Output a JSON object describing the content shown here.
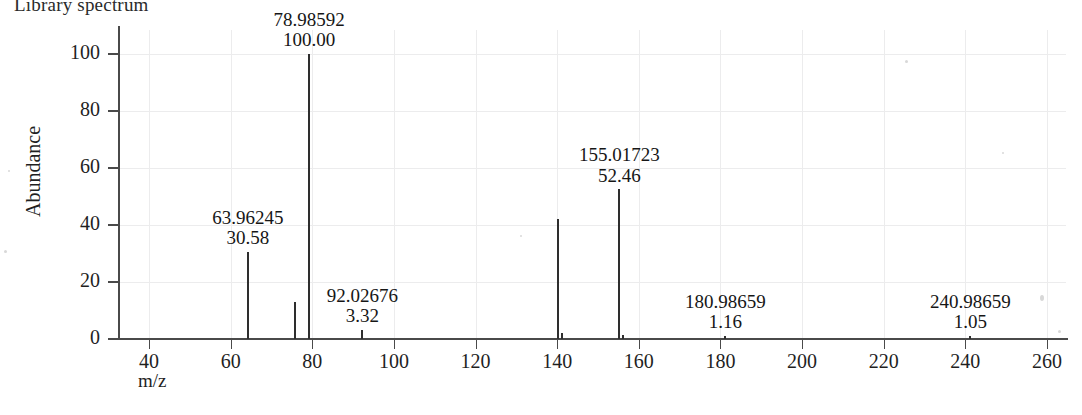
{
  "figure": {
    "title": "Library spectrum"
  },
  "axes": {
    "y_title": "Abundance",
    "x_title": "m/z",
    "y_ticks": [
      "0",
      "20",
      "40",
      "60",
      "80",
      "100"
    ],
    "x_ticks": [
      "40",
      "60",
      "80",
      "100",
      "120",
      "140",
      "160",
      "180",
      "200",
      "220",
      "240",
      "260"
    ]
  },
  "chart_data": {
    "type": "bar",
    "title": "Library spectrum",
    "xlabel": "m/z",
    "ylabel": "Abundance",
    "xlim": [
      30,
      265
    ],
    "ylim": [
      0,
      105
    ],
    "grid": true,
    "legend": "none",
    "x": [
      63.96245,
      75.5,
      78.98592,
      92.02676,
      140.0,
      155.01723,
      180.98659,
      240.98659
    ],
    "values": [
      30.58,
      13.0,
      100.0,
      3.32,
      42.0,
      52.46,
      1.16,
      1.05
    ],
    "labeled_peaks": [
      {
        "mz": "63.96245",
        "abundance": "30.58",
        "x": 63.96245,
        "y": 30.58
      },
      {
        "mz": "78.98592",
        "abundance": "100.00",
        "x": 78.98592,
        "y": 100.0
      },
      {
        "mz": "92.02676",
        "abundance": "3.32",
        "x": 92.02676,
        "y": 3.32
      },
      {
        "mz": "155.01723",
        "abundance": "52.46",
        "x": 155.01723,
        "y": 52.46
      },
      {
        "mz": "180.98659",
        "abundance": "1.16",
        "x": 180.98659,
        "y": 1.16
      },
      {
        "mz": "240.98659",
        "abundance": "1.05",
        "x": 240.98659,
        "y": 1.05
      }
    ],
    "unlabeled_peaks": [
      {
        "x": 75.5,
        "y": 13.0
      },
      {
        "x": 140.0,
        "y": 42.0
      },
      {
        "x": 141.0,
        "y": 2.2
      },
      {
        "x": 155.8,
        "y": 1.4
      }
    ]
  }
}
